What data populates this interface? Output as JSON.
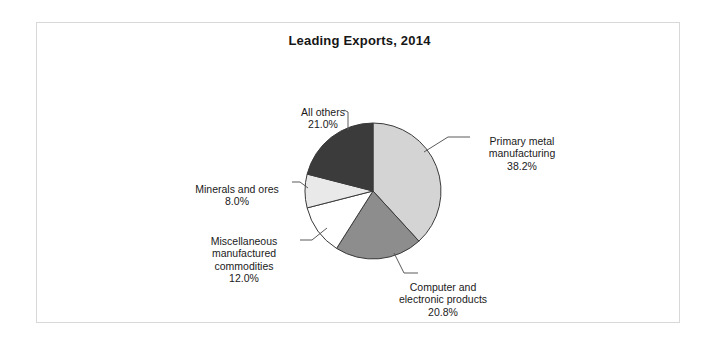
{
  "figure": {
    "title": "Leading Exports, 2014",
    "frame_color": "#d8d8d8",
    "background": "#ffffff"
  },
  "chart_data": {
    "type": "pie",
    "title": "Leading Exports, 2014",
    "xlabel": "",
    "ylabel": "",
    "legend_position": "none",
    "grid": false,
    "start_angle_deg": 90,
    "direction": "clockwise",
    "categories": [
      "Primary metal manufacturing",
      "Computer and electronic products",
      "Miscellaneous manufactured commodities",
      "Minerals and ores",
      "All others"
    ],
    "values": [
      38.2,
      20.8,
      12.0,
      8.0,
      21.0
    ],
    "value_labels": [
      "38.2%",
      "20.8%",
      "12.0%",
      "8.0%",
      "21.0%"
    ],
    "colors": [
      "#d4d4d4",
      "#8d8d8d",
      "#ffffff",
      "#e9e9e9",
      "#3b3b3b"
    ],
    "slice_edge_color": "#3a3a3a",
    "units": "percent"
  },
  "labels": {
    "primary": {
      "name": "Primary metal\nmanufacturing",
      "pct": "38.2%"
    },
    "computer": {
      "name": "Computer and\nelectronic products",
      "pct": "20.8%"
    },
    "misc": {
      "name": "Miscellaneous\nmanufactured\ncommodities",
      "pct": "12.0%"
    },
    "minerals": {
      "name": "Minerals and ores",
      "pct": "8.0%"
    },
    "allothers": {
      "name": "All others",
      "pct": "21.0%"
    }
  }
}
